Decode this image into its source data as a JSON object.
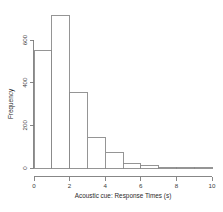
{
  "chart_data": {
    "type": "bar",
    "title": "",
    "subtitle": "",
    "xlabel": "Acoustic cue: Response Times (s)",
    "ylabel": "Frequency",
    "categories": [
      "0-1",
      "1-2",
      "2-3",
      "3-4",
      "4-5",
      "5-6",
      "6-7",
      "7-8",
      "8-9",
      "9-10"
    ],
    "bin_edges": [
      0,
      1,
      2,
      3,
      4,
      5,
      6,
      7,
      8,
      9,
      10
    ],
    "values": [
      550,
      715,
      355,
      145,
      75,
      20,
      10,
      0,
      0,
      0
    ],
    "bin_width": 1,
    "xlim": [
      0,
      10
    ],
    "ylim": [
      0,
      760
    ],
    "xticks": [
      0,
      2,
      4,
      6,
      8,
      10
    ],
    "xtick_labels": [
      "0",
      "2",
      "4",
      "6",
      "8",
      "10"
    ],
    "yticks": [
      0,
      200,
      400,
      600
    ],
    "ytick_labels": [
      "0",
      "200",
      "400",
      "600"
    ],
    "grid": false,
    "legend": null,
    "legend_position": "none",
    "bar_fill_color": "#ffffff",
    "bar_border_color": "#8a8a8a",
    "axis_color": "#7a7a7a",
    "background_color": "#ffffff",
    "ylabel_rotation": 90,
    "ytick_label_rotation": 90
  },
  "figure": {
    "width": 223,
    "height": 212
  }
}
